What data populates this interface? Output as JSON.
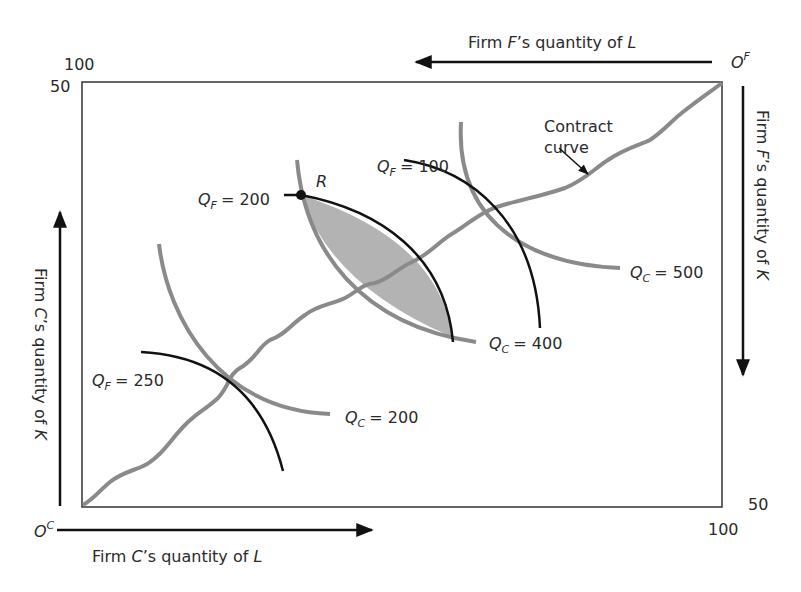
{
  "figure": {
    "type": "edgeworth-box-production",
    "origins": {
      "firm_c": {
        "letter": "O",
        "sup": "C"
      },
      "firm_f": {
        "letter": "O",
        "sup": "F"
      }
    },
    "axes": {
      "bottom": {
        "firm": "C",
        "pre": "Firm ",
        "post": "’s quantity of ",
        "input": "L",
        "direction": "right"
      },
      "top": {
        "firm": "F",
        "pre": "Firm ",
        "post": "’s quantity of ",
        "input": "L",
        "direction": "left"
      },
      "left": {
        "firm": "C",
        "pre": "Firm ",
        "post": "’s quantity of ",
        "input": "K",
        "direction": "up"
      },
      "right": {
        "firm": "F",
        "pre": "Firm ",
        "post": "’s quantity of ",
        "input": "K",
        "direction": "down"
      }
    },
    "box_dimensions": {
      "top_left_outer": "100",
      "top_left_inner": "50",
      "bottom_right_inner": "50",
      "bottom_right_outer": "100"
    },
    "point": {
      "label": "R"
    },
    "contract_curve": {
      "line1": "Contract",
      "line2": "curve"
    },
    "isoquants_firm_f": [
      {
        "q": "Q",
        "sub": "F",
        "value": "= 100"
      },
      {
        "q": "Q",
        "sub": "F",
        "value": "= 200"
      },
      {
        "q": "Q",
        "sub": "F",
        "value": "= 250"
      }
    ],
    "isoquants_firm_c": [
      {
        "q": "Q",
        "sub": "C",
        "value": "= 200"
      },
      {
        "q": "Q",
        "sub": "C",
        "value": "= 400"
      },
      {
        "q": "Q",
        "sub": "C",
        "value": "= 500"
      }
    ],
    "colors": {
      "box": "#333333",
      "firm_f_isoquant": "#111111",
      "firm_c_isoquant": "#8a8a8a",
      "contract_curve": "#8a8a8a",
      "lens_fill": "#b3b3b3",
      "text": "#2a2a2a"
    }
  }
}
